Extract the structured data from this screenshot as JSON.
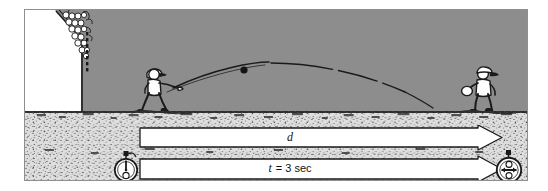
{
  "figure": {
    "caption_labels": {
      "distance_label": "d",
      "time_label_var": "t",
      "time_label_eq": "= 3 sec",
      "time_label_full": "t = 3 sec"
    }
  },
  "measurements": {
    "distance": {
      "symbol": "d",
      "value_shown": "",
      "bar_name": "distance-arrow-bar"
    },
    "time": {
      "symbol": "t",
      "value_shown": "3 sec",
      "number": 3,
      "unit": "sec",
      "bar_name": "time-arrow-bar"
    }
  },
  "scene": {
    "thrower": "thrower-figure",
    "catcher": "catcher-figure",
    "ball": "baseball",
    "trajectory": "ball-trajectory-arc",
    "bleachers": "stadium-bleachers-crowd",
    "ground": "ground-cross-section",
    "sky": "field-background"
  },
  "icons": {
    "stopwatch_start": "stopwatch-start-icon",
    "stopwatch_stop": "stopwatch-stop-icon"
  },
  "colors": {
    "sky": "#8d8d8d",
    "ground": "#dedede",
    "ink": "#1a1a1a",
    "paper": "#ffffff",
    "frame": "#8f8f8f"
  }
}
